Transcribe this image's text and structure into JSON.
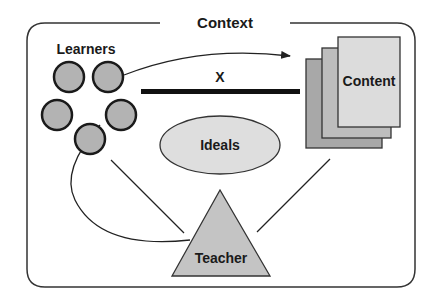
{
  "diagram": {
    "frame_label": "Context",
    "learners_label": "Learners",
    "content_label": "Content",
    "ideals_label": "Ideals",
    "teacher_label": "Teacher",
    "barrier_label": "X",
    "colors": {
      "stroke": "#222222",
      "circle_fill": "#b3b3b3",
      "page_back": "#a8a8a8",
      "page_mid": "#bdbdbd",
      "page_front": "#dcdcdc",
      "ellipse_fill": "#dedede",
      "triangle_fill": "#c4c4c4"
    }
  }
}
